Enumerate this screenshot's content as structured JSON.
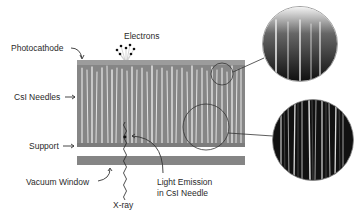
{
  "diagram": {
    "labels": {
      "electrons": "Electrons",
      "photocathode": "Photocathode",
      "csi_needles": "CsI Needles",
      "support": "Support",
      "vacuum_window": "Vacuum Window",
      "light_emission_line1": "Light Emission",
      "light_emission_line2": "in CsI Needle",
      "xray": "X-ray"
    },
    "components": [
      "photocathode-layer",
      "csi-needle-layer",
      "support-layer",
      "vacuum-window",
      "xray-path",
      "electron-emission",
      "magnified-needle-tips",
      "magnified-needle-bodies"
    ],
    "colors": {
      "layer_gray": "#8a8a8a",
      "photocathode": "#9a9a9a",
      "needle_highlight": "#e6e6e6",
      "micrograph_dark": "#111111",
      "text": "#2a2a2a"
    }
  }
}
